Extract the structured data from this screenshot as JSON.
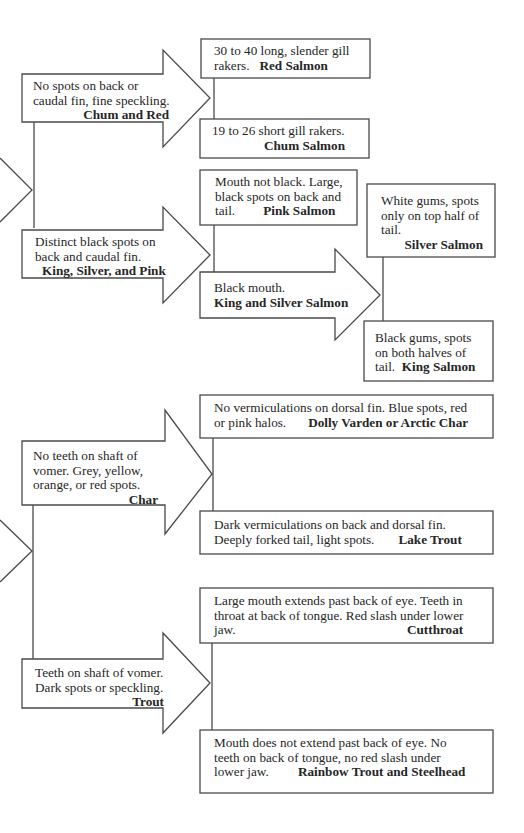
{
  "diagram": {
    "type": "dichotomous-key",
    "colors": {
      "stroke": "#4a4a4a",
      "fill": "#ffffff",
      "text": "#262626"
    },
    "salmon": {
      "chum_red": {
        "lines": [
          "No spots on back or",
          "caudal fin, fine speckling."
        ],
        "result": "Chum and Red",
        "options": {
          "red": {
            "lines": [
              "30 to 40 long, slender gill",
              "rakers."
            ],
            "result": "Red Salmon"
          },
          "chum": {
            "lines": [
              "19 to 26 short gill rakers."
            ],
            "result": "Chum Salmon"
          }
        }
      },
      "king_silver_pink": {
        "lines": [
          "Distinct black spots on",
          "back and caudal fin."
        ],
        "result": "King, Silver, and Pink",
        "options": {
          "pink": {
            "lines": [
              "Mouth not black. Large,",
              "black spots on back and",
              "tail."
            ],
            "result": "Pink Salmon"
          },
          "king_silver": {
            "lines": [
              "Black mouth."
            ],
            "result": "King and Silver Salmon",
            "options": {
              "silver": {
                "lines": [
                  "White gums, spots",
                  "only on top half of",
                  "tail."
                ],
                "result": "Silver Salmon"
              },
              "king": {
                "lines": [
                  "Black gums, spots",
                  "on both halves of",
                  "tail."
                ],
                "result": "King Salmon"
              }
            }
          }
        }
      }
    },
    "char_trout": {
      "char": {
        "lines": [
          "No teeth on shaft of",
          "vomer. Grey, yellow,",
          "orange, or red spots."
        ],
        "result": "Char",
        "options": {
          "dolly": {
            "lines": [
              "No vermiculations on dorsal fin. Blue spots, red",
              "or pink halos."
            ],
            "result": "Dolly Varden or Arctic Char"
          },
          "lake": {
            "lines": [
              "Dark vermiculations on back and dorsal fin.",
              "Deeply forked tail, light spots."
            ],
            "result": "Lake Trout"
          }
        }
      },
      "trout": {
        "lines": [
          "Teeth on shaft of vomer.",
          "Dark spots or speckling."
        ],
        "result": "Trout",
        "options": {
          "cutthroat": {
            "lines": [
              "Large mouth extends past back of eye. Teeth in",
              "throat at back of tongue. Red slash under lower",
              "jaw."
            ],
            "result": "Cutthroat"
          },
          "rainbow": {
            "lines": [
              "Mouth does not extend past back of eye.  No",
              "teeth on back of tongue, no red slash under",
              "lower jaw."
            ],
            "result": "Rainbow Trout and Steelhead"
          }
        }
      }
    }
  }
}
